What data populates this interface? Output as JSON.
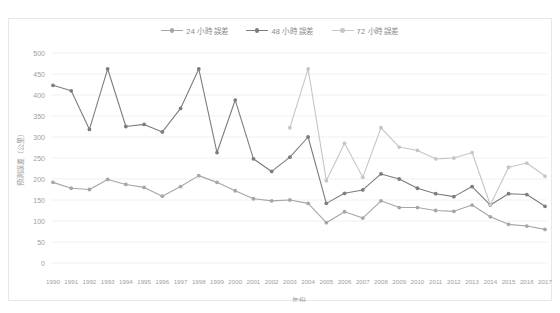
{
  "chart_data": {
    "type": "line",
    "title": "",
    "xlabel": "年份",
    "ylabel": "預測誤差（公里）",
    "xlim": [
      1990,
      2017
    ],
    "ylim": [
      0,
      500
    ],
    "grid": true,
    "legend_position": "top-center",
    "ytick_labels": [
      "500",
      "450",
      "400",
      "350",
      "300",
      "250",
      "200",
      "150",
      "100",
      "50",
      "0"
    ],
    "ytick_values": [
      500,
      450,
      400,
      350,
      300,
      250,
      200,
      150,
      100,
      50,
      0
    ],
    "categories": [
      1990,
      1991,
      1992,
      1993,
      1994,
      1995,
      1996,
      1997,
      1998,
      1999,
      2000,
      2001,
      2002,
      2003,
      2004,
      2005,
      2006,
      2007,
      2008,
      2009,
      2010,
      2011,
      2012,
      2013,
      2014,
      2015,
      2016,
      2017
    ],
    "xtick_labels": [
      "1990",
      "1991",
      "1992",
      "1993",
      "1994",
      "1995",
      "1996",
      "1997",
      "1998",
      "1999",
      "2000",
      "2001",
      "2002",
      "2003",
      "2004",
      "2005",
      "2006",
      "2007",
      "2008",
      "2009",
      "2010",
      "2011",
      "2012",
      "2013",
      "2014",
      "2015",
      "2016",
      "2017"
    ],
    "series": [
      {
        "name": "24 小時 誤差",
        "color": "#a6a6a6",
        "values": [
          192,
          178,
          175,
          199,
          187,
          180,
          159,
          182,
          208,
          192,
          172,
          153,
          148,
          150,
          142,
          96,
          122,
          107,
          148,
          132,
          132,
          125,
          123,
          138,
          110,
          92,
          88,
          80
        ]
      },
      {
        "name": "48 小時 誤差",
        "color": "#808080",
        "values": [
          null,
          null,
          null,
          null,
          null,
          null,
          null,
          null,
          null,
          null,
          null,
          null,
          null,
          null,
          null,
          null,
          null,
          null,
          null,
          null,
          null,
          null,
          null,
          null,
          null,
          null,
          null,
          null
        ]
      },
      {
        "name": "72 小時 誤差",
        "color": "#c4c4c4",
        "values": [
          null,
          null,
          null,
          null,
          null,
          null,
          null,
          null,
          null,
          null,
          null,
          null,
          null,
          322,
          462,
          196,
          285,
          204,
          322,
          276,
          268,
          248,
          250,
          263,
          138,
          228,
          238,
          207
        ]
      }
    ],
    "series_full": [
      {
        "name": "24 小時 誤差",
        "key": "s24",
        "color": "#a6a6a6",
        "marker": "circle",
        "values": [
          192,
          178,
          175,
          199,
          187,
          180,
          159,
          182,
          208,
          192,
          172,
          153,
          148,
          150,
          142,
          96,
          122,
          107,
          148,
          132,
          132,
          125,
          123,
          138,
          110,
          92,
          88,
          80
        ]
      },
      {
        "name": "48 小時 誤差",
        "key": "s48",
        "color": "#7d7d7d",
        "marker": "circle",
        "values": [
          423,
          410,
          318,
          462,
          325,
          330,
          312,
          368,
          462,
          263,
          388,
          248,
          218,
          252,
          300,
          142,
          166,
          174,
          212,
          200,
          178,
          165,
          158,
          182,
          138,
          165,
          163,
          135
        ]
      },
      {
        "name": "72 小時 誤差",
        "key": "s72",
        "color": "#c6c6c6",
        "marker": "circle",
        "values": [
          null,
          null,
          null,
          null,
          null,
          null,
          null,
          null,
          null,
          null,
          null,
          null,
          null,
          322,
          462,
          196,
          285,
          204,
          322,
          276,
          268,
          248,
          250,
          263,
          138,
          228,
          238,
          207
        ]
      }
    ]
  },
  "legend": {
    "items": [
      {
        "label": "24 小時 誤差",
        "color": "#a6a6a6"
      },
      {
        "label": "48 小時 誤差",
        "color": "#7d7d7d"
      },
      {
        "label": "72 小時 誤差",
        "color": "#c6c6c6"
      }
    ]
  }
}
